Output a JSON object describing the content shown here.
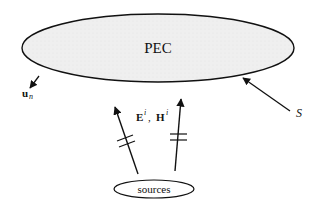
{
  "diagram": {
    "body_label": "PEC",
    "normal_label": "u",
    "normal_subscript": "n",
    "surface_label": "S",
    "field_E": "E",
    "field_H": "H",
    "field_superscript": "i",
    "field_separator": ",",
    "source_label": "sources",
    "colors": {
      "line": "#111111",
      "body_fill": "#eeeeee",
      "background": "#ffffff"
    }
  }
}
